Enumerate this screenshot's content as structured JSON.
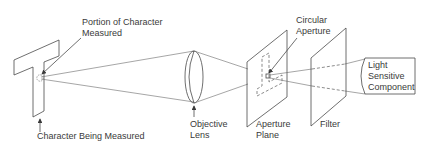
{
  "diagram": {
    "type": "optical-measurement-schematic",
    "labels": {
      "portion_line1": "Portion of Character",
      "portion_line2": "Measured",
      "character": "Character Being Measured",
      "lens_line1": "Objective",
      "lens_line2": "Lens",
      "aperture_plane_line1": "Aperture",
      "aperture_plane_line2": "Plane",
      "circular_line1": "Circular",
      "circular_line2": "Aperture",
      "filter": "Filter",
      "sensor_line1": "Light",
      "sensor_line2": "Sensitive",
      "sensor_line3": "Component"
    },
    "components": [
      "character-being-measured",
      "portion-of-character-measured",
      "objective-lens",
      "aperture-plane",
      "circular-aperture",
      "filter",
      "light-sensitive-component"
    ],
    "colors": {
      "background": "#ffffff",
      "line": "#4a4a4a",
      "text": "#3a3a3a"
    }
  }
}
